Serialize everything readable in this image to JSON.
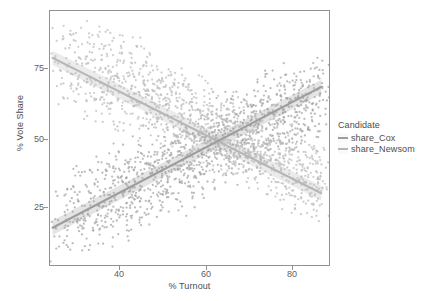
{
  "chart_data": {
    "type": "scatter",
    "title": "",
    "xlabel": "% Turnout",
    "ylabel": "% Vote Share",
    "xlim": [
      30,
      84
    ],
    "ylim": [
      4,
      96
    ],
    "xticks": [
      40,
      60,
      80
    ],
    "yticks": [
      25,
      50,
      75
    ],
    "xtick_labels": [
      "40",
      "60",
      "80"
    ],
    "ytick_labels": [
      "25",
      "50",
      "75"
    ],
    "grid": false,
    "legend_position": "right",
    "legend_title": "Candidate",
    "series": [
      {
        "name": "share_Cox",
        "color": "#9d9d9d",
        "point_color": "#a6a6a6",
        "trend": "increasing",
        "fit_line": {
          "x": [
            30.5,
            82.5
          ],
          "y": [
            17.5,
            68.5
          ]
        },
        "fit_slope": 0.98,
        "fit_intercept": -12.4,
        "points": [
          [
            31.0,
            17.5
          ],
          [
            32.6,
            12.0
          ],
          [
            33.4,
            24.0
          ],
          [
            34.1,
            31.5
          ],
          [
            34.8,
            20.5
          ],
          [
            35.5,
            27.0
          ],
          [
            36.2,
            18.0
          ],
          [
            36.9,
            33.0
          ],
          [
            37.3,
            22.5
          ],
          [
            37.9,
            28.0
          ],
          [
            38.4,
            16.5
          ],
          [
            38.9,
            35.0
          ],
          [
            39.5,
            25.5
          ],
          [
            40.0,
            20.0
          ],
          [
            40.4,
            30.5
          ],
          [
            40.9,
            38.0
          ],
          [
            41.3,
            24.0
          ],
          [
            41.8,
            18.5
          ],
          [
            42.2,
            33.5
          ],
          [
            42.7,
            27.5
          ],
          [
            43.1,
            36.0
          ],
          [
            43.6,
            22.0
          ],
          [
            44.0,
            30.0
          ],
          [
            44.5,
            40.5
          ],
          [
            44.9,
            26.5
          ],
          [
            45.3,
            34.0
          ],
          [
            45.8,
            21.0
          ],
          [
            46.2,
            38.5
          ],
          [
            46.6,
            29.0
          ],
          [
            47.0,
            43.0
          ],
          [
            47.5,
            25.0
          ],
          [
            47.9,
            35.5
          ],
          [
            48.3,
            31.0
          ],
          [
            48.7,
            41.0
          ],
          [
            49.1,
            27.0
          ],
          [
            49.5,
            37.0
          ],
          [
            49.9,
            33.0
          ],
          [
            50.3,
            45.0
          ],
          [
            50.7,
            29.5
          ],
          [
            51.1,
            39.0
          ],
          [
            51.5,
            34.5
          ],
          [
            51.9,
            47.0
          ],
          [
            52.3,
            31.5
          ],
          [
            52.7,
            41.5
          ],
          [
            53.1,
            36.0
          ],
          [
            53.5,
            44.0
          ],
          [
            53.9,
            30.0
          ],
          [
            54.3,
            38.5
          ],
          [
            54.7,
            49.0
          ],
          [
            55.1,
            34.0
          ],
          [
            55.5,
            42.0
          ],
          [
            55.9,
            36.5
          ],
          [
            56.3,
            47.5
          ],
          [
            56.7,
            32.5
          ],
          [
            57.1,
            44.5
          ],
          [
            57.5,
            39.0
          ],
          [
            57.9,
            50.5
          ],
          [
            58.3,
            35.5
          ],
          [
            58.7,
            46.0
          ],
          [
            59.1,
            41.0
          ],
          [
            59.5,
            52.0
          ],
          [
            59.9,
            37.0
          ],
          [
            60.3,
            48.0
          ],
          [
            60.7,
            43.0
          ],
          [
            61.1,
            54.0
          ],
          [
            61.5,
            38.5
          ],
          [
            61.9,
            49.5
          ],
          [
            62.3,
            44.5
          ],
          [
            62.7,
            55.5
          ],
          [
            63.1,
            40.0
          ],
          [
            63.5,
            51.0
          ],
          [
            63.9,
            46.0
          ],
          [
            64.3,
            57.0
          ],
          [
            64.7,
            41.5
          ],
          [
            65.1,
            52.5
          ],
          [
            65.5,
            47.5
          ],
          [
            65.9,
            58.5
          ],
          [
            66.3,
            43.0
          ],
          [
            66.7,
            54.0
          ],
          [
            67.1,
            49.0
          ],
          [
            67.5,
            60.0
          ],
          [
            67.9,
            44.5
          ],
          [
            68.3,
            55.5
          ],
          [
            68.7,
            50.5
          ],
          [
            69.1,
            61.5
          ],
          [
            69.5,
            46.0
          ],
          [
            69.9,
            57.0
          ],
          [
            70.3,
            52.0
          ],
          [
            70.7,
            63.0
          ],
          [
            71.1,
            47.5
          ],
          [
            71.5,
            58.5
          ],
          [
            71.9,
            53.5
          ],
          [
            72.3,
            64.5
          ],
          [
            72.7,
            49.0
          ],
          [
            73.1,
            60.0
          ],
          [
            73.5,
            55.0
          ],
          [
            73.9,
            66.0
          ],
          [
            74.3,
            50.5
          ],
          [
            74.7,
            61.5
          ],
          [
            75.1,
            56.5
          ],
          [
            75.5,
            67.5
          ],
          [
            75.9,
            52.0
          ],
          [
            76.3,
            63.0
          ],
          [
            76.7,
            58.0
          ],
          [
            77.1,
            69.0
          ],
          [
            77.5,
            53.5
          ],
          [
            77.9,
            64.5
          ],
          [
            78.3,
            59.5
          ],
          [
            78.7,
            70.0
          ],
          [
            79.1,
            55.0
          ],
          [
            79.5,
            66.0
          ],
          [
            79.9,
            61.0
          ],
          [
            80.3,
            71.0
          ],
          [
            80.7,
            56.5
          ],
          [
            81.1,
            67.0
          ],
          [
            81.5,
            62.0
          ],
          [
            81.9,
            72.0
          ],
          [
            82.3,
            58.0
          ],
          [
            82.7,
            68.0
          ]
        ]
      },
      {
        "name": "share_Newsom",
        "color": "#b6b6b6",
        "point_color": "#bdbdbd",
        "trend": "decreasing",
        "fit_line": {
          "x": [
            30.5,
            82.5
          ],
          "y": [
            79.0,
            30.0
          ]
        },
        "fit_slope": -0.94,
        "fit_intercept": 107.7,
        "points": [
          [
            31.0,
            79.0
          ],
          [
            32.6,
            86.0
          ],
          [
            33.4,
            74.0
          ],
          [
            34.1,
            68.0
          ],
          [
            34.8,
            81.0
          ],
          [
            35.5,
            72.0
          ],
          [
            36.2,
            84.0
          ],
          [
            36.9,
            66.0
          ],
          [
            37.3,
            77.0
          ],
          [
            37.9,
            71.0
          ],
          [
            38.4,
            83.0
          ],
          [
            38.9,
            64.0
          ],
          [
            39.5,
            74.5
          ],
          [
            40.0,
            80.0
          ],
          [
            40.4,
            69.0
          ],
          [
            41.0,
            61.5
          ],
          [
            41.3,
            76.0
          ],
          [
            41.8,
            82.0
          ],
          [
            42.2,
            66.5
          ],
          [
            42.7,
            72.5
          ],
          [
            43.1,
            63.5
          ],
          [
            43.6,
            78.0
          ],
          [
            44.0,
            70.0
          ],
          [
            44.5,
            59.5
          ],
          [
            44.9,
            73.5
          ],
          [
            45.3,
            66.0
          ],
          [
            45.8,
            79.0
          ],
          [
            46.2,
            61.5
          ],
          [
            46.6,
            71.0
          ],
          [
            47.0,
            57.0
          ],
          [
            47.5,
            75.0
          ],
          [
            47.9,
            64.5
          ],
          [
            48.3,
            69.0
          ],
          [
            48.7,
            59.0
          ],
          [
            49.1,
            73.0
          ],
          [
            49.5,
            63.0
          ],
          [
            49.9,
            67.0
          ],
          [
            50.3,
            55.0
          ],
          [
            50.7,
            70.5
          ],
          [
            51.1,
            61.0
          ],
          [
            51.5,
            65.5
          ],
          [
            51.9,
            53.0
          ],
          [
            52.3,
            68.5
          ],
          [
            52.7,
            58.5
          ],
          [
            53.1,
            64.0
          ],
          [
            53.5,
            56.0
          ],
          [
            53.9,
            70.0
          ],
          [
            54.3,
            61.5
          ],
          [
            54.7,
            51.0
          ],
          [
            55.1,
            66.0
          ],
          [
            55.5,
            58.0
          ],
          [
            55.9,
            63.5
          ],
          [
            56.3,
            52.5
          ],
          [
            56.7,
            67.5
          ],
          [
            57.1,
            55.5
          ],
          [
            57.5,
            61.0
          ],
          [
            57.9,
            49.5
          ],
          [
            58.3,
            64.5
          ],
          [
            58.7,
            54.0
          ],
          [
            59.1,
            59.0
          ],
          [
            59.5,
            48.0
          ],
          [
            59.9,
            63.0
          ],
          [
            60.3,
            52.0
          ],
          [
            60.7,
            57.0
          ],
          [
            61.1,
            46.0
          ],
          [
            61.5,
            61.5
          ],
          [
            61.9,
            50.5
          ],
          [
            62.3,
            55.5
          ],
          [
            62.7,
            44.5
          ],
          [
            63.1,
            60.0
          ],
          [
            63.5,
            49.0
          ],
          [
            63.9,
            54.0
          ],
          [
            64.3,
            43.0
          ],
          [
            64.7,
            58.5
          ],
          [
            65.1,
            47.5
          ],
          [
            65.5,
            52.5
          ],
          [
            65.9,
            41.5
          ],
          [
            66.3,
            57.0
          ],
          [
            66.7,
            46.0
          ],
          [
            67.1,
            51.0
          ],
          [
            67.5,
            40.0
          ],
          [
            67.9,
            55.5
          ],
          [
            68.3,
            44.5
          ],
          [
            68.7,
            49.5
          ],
          [
            69.1,
            38.5
          ],
          [
            69.5,
            54.0
          ],
          [
            69.9,
            43.0
          ],
          [
            70.3,
            48.0
          ],
          [
            70.7,
            37.0
          ],
          [
            71.1,
            52.5
          ],
          [
            71.5,
            41.5
          ],
          [
            71.9,
            46.5
          ],
          [
            72.3,
            35.5
          ],
          [
            72.7,
            51.0
          ],
          [
            73.1,
            40.0
          ],
          [
            73.5,
            45.0
          ],
          [
            73.9,
            34.0
          ],
          [
            74.3,
            49.5
          ],
          [
            74.7,
            38.5
          ],
          [
            75.1,
            43.5
          ],
          [
            75.5,
            32.5
          ],
          [
            75.9,
            48.0
          ],
          [
            76.3,
            37.0
          ],
          [
            76.7,
            42.0
          ],
          [
            77.1,
            31.0
          ],
          [
            77.5,
            46.5
          ],
          [
            77.9,
            35.5
          ],
          [
            78.3,
            40.5
          ],
          [
            78.7,
            30.0
          ],
          [
            79.1,
            45.0
          ],
          [
            79.5,
            34.0
          ],
          [
            79.9,
            39.0
          ],
          [
            80.3,
            29.0
          ],
          [
            80.7,
            43.5
          ],
          [
            81.1,
            33.0
          ],
          [
            81.5,
            38.0
          ],
          [
            81.9,
            28.0
          ],
          [
            82.3,
            42.0
          ],
          [
            82.7,
            32.0
          ]
        ]
      }
    ]
  },
  "axes": {
    "x_title": "% Turnout",
    "y_title": "% Vote Share",
    "x_ticks": [
      "40",
      "60",
      "80"
    ],
    "y_ticks": [
      "75",
      "50",
      "25"
    ]
  },
  "legend": {
    "title": "Candidate",
    "items": [
      {
        "label": "share_Cox",
        "color": "#9d9d9d"
      },
      {
        "label": "share_Newsom",
        "color": "#bdbdbd"
      }
    ]
  },
  "style": {
    "panel_background": "#ffffff",
    "panel_border": "#8f9294",
    "text_color": "#4d4d4d",
    "tick_color": "#606060"
  }
}
